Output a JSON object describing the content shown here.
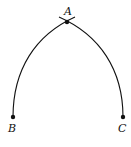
{
  "diagram": {
    "type": "geometric-construction",
    "points": [
      {
        "label": "A",
        "x": 67,
        "y": 22,
        "label_x": 62,
        "label_y": 15
      },
      {
        "label": "B",
        "x": 13,
        "y": 117,
        "label_x": 8,
        "label_y": 131
      },
      {
        "label": "C",
        "x": 123,
        "y": 117,
        "label_x": 118,
        "label_y": 131
      }
    ],
    "arcs": [
      {
        "from": "B",
        "to": "A",
        "description": "arc from B curving up to A"
      },
      {
        "from": "C",
        "to": "A",
        "description": "arc from C curving up to A"
      }
    ],
    "stroke_color": "#111111"
  }
}
